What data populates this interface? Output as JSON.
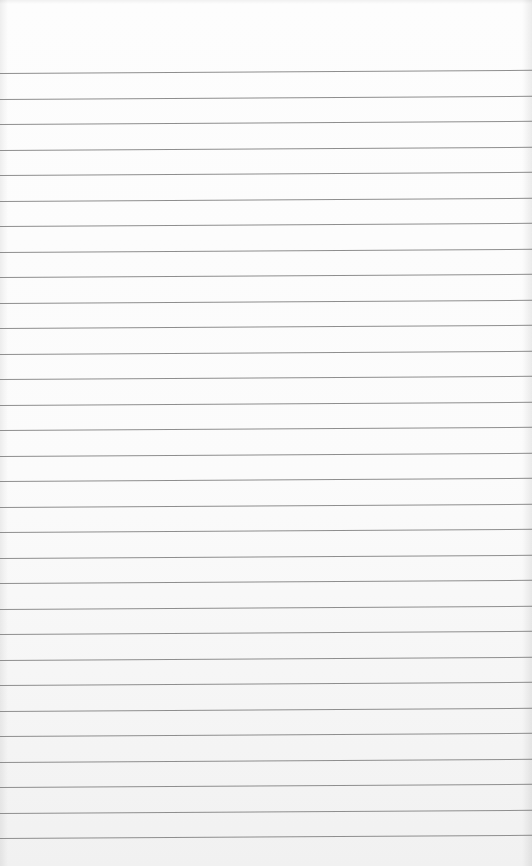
{
  "image": {
    "subject": "blank lined notebook paper",
    "width": 532,
    "height": 866,
    "paper_color": "#fbfbfb",
    "rule_color": "#8e8e8e",
    "rules": {
      "count": 31,
      "first_y": 73,
      "spacing": 25.5,
      "tilt_deg": -0.35
    }
  }
}
